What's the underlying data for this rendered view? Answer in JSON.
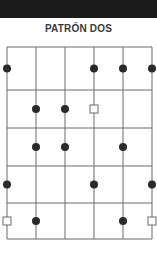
{
  "header": {
    "title": "PATRÓN DOS"
  },
  "colors": {
    "band": "#1a1a1a",
    "line": "#6b6b6b",
    "dot": "#2a2a2a",
    "square_stroke": "#6b6b6b"
  },
  "diagram": {
    "strings_x": [
      7,
      36,
      65,
      94,
      123,
      152
    ],
    "frets_y": [
      47,
      90,
      128,
      166,
      203,
      239
    ],
    "markers": [
      {
        "string": 0,
        "fret": 0,
        "type": "dot"
      },
      {
        "string": 3,
        "fret": 0,
        "type": "dot"
      },
      {
        "string": 4,
        "fret": 0,
        "type": "dot"
      },
      {
        "string": 5,
        "fret": 0,
        "type": "dot"
      },
      {
        "string": 1,
        "fret": 1,
        "type": "dot"
      },
      {
        "string": 2,
        "fret": 1,
        "type": "dot"
      },
      {
        "string": 3,
        "fret": 1,
        "type": "square"
      },
      {
        "string": 1,
        "fret": 2,
        "type": "dot"
      },
      {
        "string": 2,
        "fret": 2,
        "type": "dot"
      },
      {
        "string": 4,
        "fret": 2,
        "type": "dot"
      },
      {
        "string": 0,
        "fret": 3,
        "type": "dot"
      },
      {
        "string": 3,
        "fret": 3,
        "type": "dot"
      },
      {
        "string": 5,
        "fret": 3,
        "type": "dot"
      },
      {
        "string": 0,
        "fret": 4,
        "type": "square"
      },
      {
        "string": 1,
        "fret": 4,
        "type": "dot"
      },
      {
        "string": 4,
        "fret": 4,
        "type": "dot"
      },
      {
        "string": 5,
        "fret": 4,
        "type": "square"
      }
    ]
  }
}
